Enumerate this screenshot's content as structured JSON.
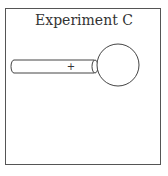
{
  "title": "Experiment C",
  "rod": {
    "charge_label": "+"
  },
  "colors": {
    "stroke": "#444444",
    "background": "#ffffff"
  }
}
